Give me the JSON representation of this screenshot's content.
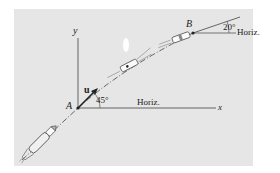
{
  "figure": {
    "type": "kinematics diagram",
    "colors": {
      "panel_background": "#e6e6e6",
      "page_background": "#ffffff",
      "ink": "#333333"
    }
  },
  "axes": {
    "y_label": "y",
    "x_label": "x"
  },
  "points": {
    "A": "A",
    "B": "B"
  },
  "vector": {
    "label": "u"
  },
  "angles": {
    "at_A": "45°",
    "at_B": "20°"
  },
  "references": {
    "horiz_A": "Horiz.",
    "horiz_B": "Horiz."
  }
}
